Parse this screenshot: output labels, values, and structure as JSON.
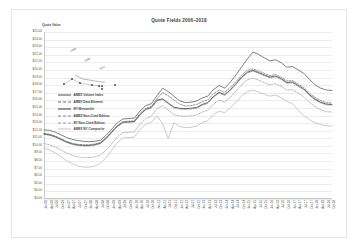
{
  "chart_data": {
    "type": "line",
    "title": "Quote Fields 2006–2018",
    "xlabel": "",
    "ylabel": "Quote Value",
    "ylim": [
      3.0,
      25.0
    ],
    "grid": true,
    "legend_position": "inside-left",
    "y_ticks": [
      "$25.00",
      "$24.00",
      "$23.00",
      "$22.00",
      "$21.00",
      "$20.00",
      "$19.00",
      "$18.00",
      "$17.00",
      "$16.00",
      "$15.00",
      "$14.00",
      "$13.00",
      "$12.00",
      "$11.00",
      "$10.00",
      "$9.00",
      "$8.00",
      "$7.00",
      "$6.00",
      "$5.00",
      "$4.00",
      "$3.00"
    ],
    "categories": [
      "Jan-06",
      "Apr-06",
      "Jul-06",
      "Oct-06",
      "Jan-07",
      "Apr-07",
      "Jul-07",
      "Oct-07",
      "Jan-08",
      "Apr-08",
      "Jul-08",
      "Oct-08",
      "Jan-09",
      "Apr-09",
      "Jul-09",
      "Oct-09",
      "Jan-10",
      "Apr-10",
      "Jul-10",
      "Oct-10",
      "Jan-11",
      "Apr-11",
      "Jul-11",
      "Oct-11",
      "Jan-12",
      "Apr-12",
      "Jul-12",
      "Oct-12",
      "Jan-13",
      "Apr-13",
      "Jul-13",
      "Oct-13",
      "Jan-14",
      "Apr-14",
      "Jul-14",
      "Oct-14",
      "Jan-15",
      "Apr-15",
      "Jul-15",
      "Oct-15",
      "Jan-16",
      "Apr-16",
      "Jul-16",
      "Oct-16",
      "Jan-17",
      "Apr-17",
      "Jul-17",
      "Oct-17",
      "Jan-18",
      "Apr-18",
      "Jul-18",
      "Oct-18"
    ],
    "series": [
      {
        "name": "AMEX Volume Index",
        "color": "#4a4a4a",
        "style": "solid",
        "width": 0.7,
        "values": [
          12.1,
          12.05,
          11.8,
          11.45,
          11.1,
          10.85,
          10.7,
          10.6,
          10.55,
          10.6,
          10.75,
          11.4,
          12.2,
          13.05,
          13.55,
          13.6,
          13.65,
          14.6,
          15.3,
          15.55,
          16.6,
          17.6,
          17.15,
          16.55,
          15.95,
          15.7,
          15.75,
          15.9,
          16.3,
          16.55,
          17.4,
          17.95,
          17.6,
          18.4,
          19.35,
          20.4,
          21.45,
          22.35,
          22.05,
          21.6,
          21.2,
          21.35,
          20.95,
          20.35,
          20.45,
          20.0,
          19.55,
          18.75,
          18.05,
          17.6,
          17.35,
          17.3
        ]
      },
      {
        "name": "AMEX Data Element",
        "color": "#6b6b6b",
        "style": "dashed",
        "width": 0.7,
        "values": [
          11.65,
          11.55,
          11.3,
          10.95,
          10.6,
          10.35,
          10.2,
          10.15,
          10.15,
          10.25,
          10.45,
          11.1,
          11.9,
          12.7,
          13.2,
          13.25,
          13.3,
          14.25,
          14.95,
          15.2,
          16.2,
          17.05,
          16.6,
          16.05,
          15.5,
          15.25,
          15.3,
          15.45,
          15.8,
          16.05,
          16.85,
          17.35,
          17.05,
          17.7,
          18.45,
          19.3,
          19.95,
          20.15,
          19.85,
          19.55,
          19.25,
          19.4,
          19.05,
          18.55,
          18.6,
          18.15,
          17.7,
          16.95,
          16.35,
          15.95,
          15.7,
          15.65
        ]
      },
      {
        "name": "NY Mercantile",
        "color": "#3a3a3a",
        "style": "solid",
        "width": 0.8,
        "values": [
          11.55,
          11.45,
          11.2,
          10.85,
          10.5,
          10.25,
          10.1,
          10.05,
          10.05,
          10.15,
          10.35,
          11.0,
          11.8,
          12.6,
          13.1,
          13.15,
          13.2,
          14.1,
          14.8,
          15.05,
          16.0,
          16.2,
          15.65,
          15.1,
          14.95,
          14.9,
          14.95,
          15.05,
          15.45,
          15.7,
          16.5,
          17.05,
          16.75,
          17.4,
          18.2,
          19.05,
          19.7,
          19.95,
          19.65,
          19.35,
          19.05,
          19.2,
          18.85,
          18.35,
          18.4,
          17.95,
          17.5,
          16.75,
          16.15,
          15.75,
          15.5,
          15.45
        ]
      },
      {
        "name": "AMEX Non-Cited Edition",
        "color": "#858585",
        "style": "dash-dot",
        "width": 0.7,
        "values": [
          11.5,
          11.4,
          11.15,
          10.8,
          10.45,
          10.2,
          10.05,
          10.0,
          10.0,
          10.1,
          10.3,
          10.95,
          11.75,
          12.55,
          13.05,
          13.1,
          13.15,
          14.05,
          14.75,
          15.0,
          15.9,
          16.1,
          15.55,
          15.0,
          14.85,
          14.8,
          14.85,
          14.95,
          15.35,
          15.6,
          16.4,
          16.95,
          16.65,
          17.3,
          18.1,
          18.95,
          19.6,
          19.85,
          19.55,
          19.25,
          18.95,
          19.1,
          18.75,
          18.25,
          18.3,
          17.85,
          17.4,
          16.65,
          16.05,
          15.65,
          15.4,
          15.35
        ]
      },
      {
        "name": "NY Non-Cited Edition",
        "color": "#9d9d9d",
        "style": "dashed",
        "width": 0.7,
        "values": [
          10.3,
          10.15,
          9.85,
          9.45,
          9.05,
          8.75,
          8.55,
          8.45,
          8.45,
          8.55,
          8.8,
          9.45,
          10.3,
          11.2,
          11.75,
          11.8,
          11.85,
          12.85,
          13.6,
          13.9,
          14.9,
          15.3,
          14.7,
          14.1,
          13.95,
          13.9,
          13.95,
          14.05,
          14.45,
          14.7,
          15.5,
          16.05,
          15.75,
          16.4,
          17.2,
          18.05,
          18.7,
          18.95,
          18.65,
          18.35,
          18.05,
          18.2,
          17.85,
          17.35,
          17.4,
          16.95,
          16.5,
          15.75,
          15.15,
          14.75,
          14.5,
          14.45
        ]
      },
      {
        "name": "AMEX NY Composite",
        "color": "#c4c4c4",
        "style": "solid",
        "width": 0.9,
        "values": [
          9.7,
          9.45,
          9.05,
          8.55,
          8.05,
          7.65,
          7.35,
          7.2,
          7.2,
          7.35,
          7.7,
          8.45,
          9.45,
          10.45,
          11.05,
          11.1,
          11.15,
          12.15,
          12.85,
          13.1,
          13.95,
          12.9,
          10.95,
          13.05,
          12.55,
          12.4,
          12.45,
          12.6,
          13.05,
          13.3,
          14.1,
          14.6,
          14.35,
          15.0,
          15.75,
          16.55,
          17.15,
          17.35,
          17.1,
          16.8,
          16.55,
          16.7,
          16.35,
          15.85,
          15.55,
          14.7,
          14.0,
          13.45,
          13.05,
          12.8,
          12.65,
          12.6
        ]
      }
    ],
    "annotation": {
      "label": "Quote Value",
      "points": [
        {
          "x": 6,
          "y": 44
        },
        {
          "x": 14,
          "y": 39
        },
        {
          "x": 22,
          "y": 43
        },
        {
          "x": 34,
          "y": 45
        },
        {
          "x": 41,
          "y": 46
        },
        {
          "x": 44,
          "y": 46
        },
        {
          "x": 44,
          "y": 49
        },
        {
          "x": 57,
          "y": 45
        }
      ],
      "text_labels": [
        {
          "text": "2006",
          "x": 13,
          "y": 12
        },
        {
          "text": "2009",
          "x": 27,
          "y": 22
        },
        {
          "text": "2012",
          "x": 42,
          "y": 30
        }
      ]
    }
  }
}
